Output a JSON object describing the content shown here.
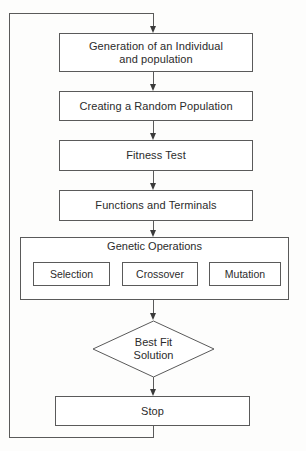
{
  "diagram": {
    "line_color": "#5a5a5a",
    "text_color": "#2b2b2b",
    "background": "#fdfdfc"
  },
  "nodes": {
    "generation": {
      "label_line1": "Generation of an Individual",
      "label_line2": "and population"
    },
    "creating_population": {
      "label": "Creating a Random Population"
    },
    "fitness_test": {
      "label": "Fitness Test"
    },
    "functions_terminals": {
      "label": "Functions and Terminals"
    },
    "genetic_operations": {
      "title": "Genetic Operations",
      "operations": [
        {
          "label": "Selection"
        },
        {
          "label": "Crossover"
        },
        {
          "label": "Mutation"
        }
      ]
    },
    "best_fit": {
      "label_line1": "Best Fit",
      "label_line2": "Solution"
    },
    "stop": {
      "label": "Stop"
    }
  }
}
